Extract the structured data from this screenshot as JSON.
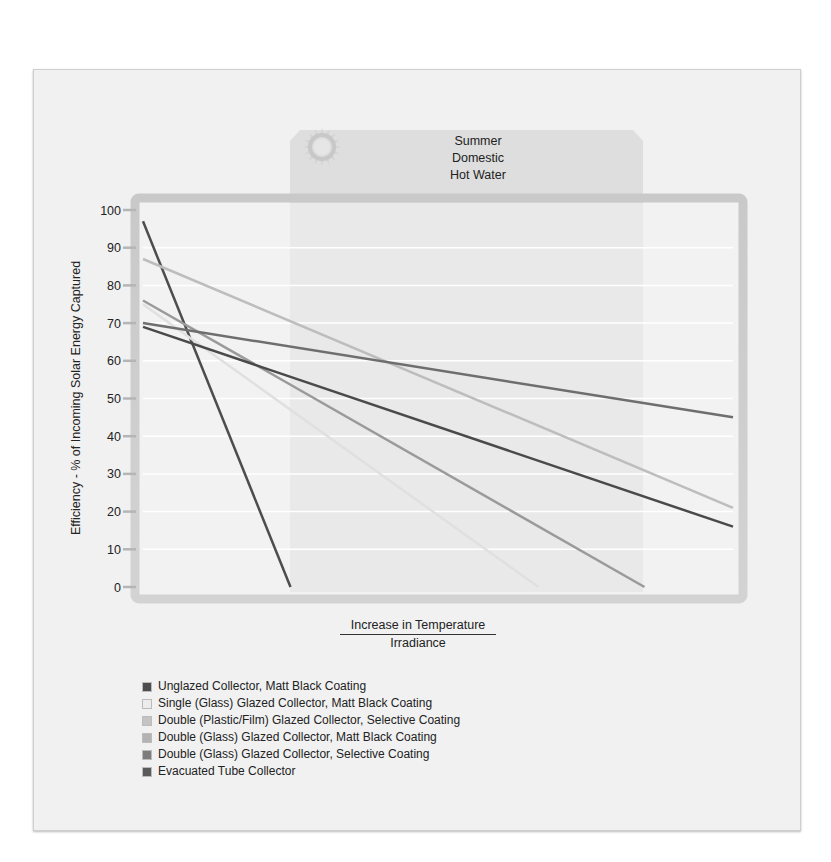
{
  "panel": {
    "line1": "Summer",
    "line2": "Domestic",
    "line3": "Hot Water",
    "icon": "sun-icon"
  },
  "axes": {
    "ylabel": "Efficiency - % of Incoming Solar Energy Captured",
    "xlabel_numerator": "Increase in Temperature",
    "xlabel_denominator": "Irradiance",
    "yticks": [
      "0",
      "10",
      "20",
      "30",
      "40",
      "50",
      "60",
      "70",
      "80",
      "90",
      "100"
    ]
  },
  "legend": [
    {
      "label": "Unglazed Collector, Matt Black Coating",
      "color": "#4d4d4d"
    },
    {
      "label": "Single (Glass) Glazed Collector, Matt Black Coating",
      "color": "#ececec"
    },
    {
      "label": "Double (Plastic/Film) Glazed Collector, Selective Coating",
      "color": "#c4c4c4"
    },
    {
      "label": "Double (Glass) Glazed Collector,  Matt Black Coating",
      "color": "#b3b3b3"
    },
    {
      "label": "Double (Glass) Glazed Collector, Selective Coating",
      "color": "#7d7d7d"
    },
    {
      "label": "Evacuated Tube Collector",
      "color": "#5a5a5a"
    }
  ],
  "chart_data": {
    "type": "line",
    "title": "Summer Domestic Hot Water",
    "xlabel": "Increase in Temperature / Irradiance",
    "ylabel": "Efficiency - % of Incoming Solar Energy Captured",
    "ylim": [
      0,
      100
    ],
    "yticks": [
      0,
      10,
      20,
      30,
      40,
      50,
      60,
      70,
      80,
      90,
      100
    ],
    "xticks": [],
    "x_range_relative": [
      0,
      1
    ],
    "highlight_band_relative": [
      0.25,
      0.86
    ],
    "highlight_band_label": "Summer Domestic Hot Water",
    "grid": true,
    "legend_position": "bottom-left",
    "series": [
      {
        "name": "Unglazed Collector, Matt Black Coating",
        "x": [
          0.0,
          0.25
        ],
        "y": [
          97,
          0
        ],
        "color": "#4d4d4d"
      },
      {
        "name": "Single (Glass) Glazed Collector, Matt Black Coating",
        "x": [
          0.0,
          0.67
        ],
        "y": [
          75,
          0
        ],
        "color": "#e0e0e0"
      },
      {
        "name": "Double (Plastic/Film) Glazed Collector, Selective Coating",
        "x": [
          0.0,
          1.0
        ],
        "y": [
          87,
          21
        ],
        "color": "#bdbdbd"
      },
      {
        "name": "Double (Glass) Glazed Collector,  Matt Black Coating",
        "x": [
          0.0,
          0.85
        ],
        "y": [
          76,
          0
        ],
        "color": "#9a9a9a"
      },
      {
        "name": "Double (Glass) Glazed Collector, Selective Coating",
        "x": [
          0.0,
          1.0
        ],
        "y": [
          70,
          45
        ],
        "color": "#6e6e6e"
      },
      {
        "name": "Evacuated Tube Collector",
        "x": [
          0.0,
          1.0
        ],
        "y": [
          69,
          16
        ],
        "color": "#4a4a4a"
      }
    ]
  }
}
